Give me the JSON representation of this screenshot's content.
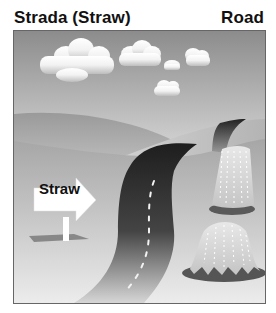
{
  "header": {
    "title_left": "Strada (Straw)",
    "title_right": "Road"
  },
  "illustration": {
    "sign_text": "Straw",
    "elements": [
      "sky-with-clouds",
      "rolling-hills",
      "road",
      "haystack-small",
      "haystack-large",
      "arrow-sign"
    ]
  }
}
